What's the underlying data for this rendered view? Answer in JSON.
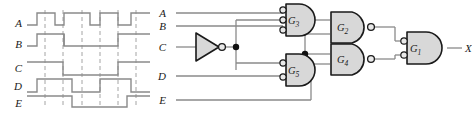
{
  "figure": {
    "wire_color": "#8a8a8a",
    "gate_stroke": "#1a1a1a",
    "gate_fill": "#d8d8d8",
    "dash_color": "#9a9a9a",
    "label_color": "#1a1a1a"
  },
  "timing": {
    "panel_label": "timing-diagram",
    "signals": [
      {
        "name": "A",
        "label": "A",
        "row": 0,
        "waveform": [
          0,
          1,
          0,
          1,
          1,
          0,
          1,
          0,
          1,
          0,
          1
        ],
        "description": "five pulses high"
      },
      {
        "name": "B",
        "label": "B",
        "row": 1,
        "waveform": [
          0,
          0,
          0,
          1,
          1,
          1,
          1,
          0,
          0,
          0,
          0
        ],
        "description": "one wide pulse in middle"
      },
      {
        "name": "C",
        "label": "C",
        "row": 2,
        "waveform": [
          1,
          1,
          1,
          0,
          0,
          0,
          0,
          0,
          1,
          1,
          1
        ],
        "description": "high at start, low in middle, high at end"
      },
      {
        "name": "D",
        "label": "D",
        "row": 3,
        "waveform": [
          0,
          1,
          1,
          0,
          0,
          0,
          1,
          1,
          1,
          0,
          0
        ],
        "description": "two high segments"
      },
      {
        "name": "E",
        "label": "E",
        "row": 4,
        "waveform": [
          0,
          0,
          0,
          1,
          1,
          1,
          1,
          1,
          0,
          0,
          0
        ],
        "description": "one wide pulse"
      }
    ],
    "gridline_count": 6
  },
  "circuit": {
    "panel_label": "logic-circuit",
    "inputs": [
      {
        "id": "in-A",
        "label": "A"
      },
      {
        "id": "in-B",
        "label": "B"
      },
      {
        "id": "in-C",
        "label": "C"
      },
      {
        "id": "in-D",
        "label": "D"
      },
      {
        "id": "in-E",
        "label": "E"
      }
    ],
    "output": {
      "id": "out-X",
      "label": "X"
    },
    "inverter": {
      "id": "inv-C",
      "label": "",
      "type": "inverter"
    },
    "gates": [
      {
        "id": "G3",
        "label": "G",
        "sub": "3",
        "type": "and-inverted-inputs",
        "inputs": 3
      },
      {
        "id": "G5",
        "label": "G",
        "sub": "5",
        "type": "and-inverted-inputs",
        "inputs": 2
      },
      {
        "id": "G2",
        "label": "G",
        "sub": "2",
        "type": "nand",
        "inputs": 2
      },
      {
        "id": "G4",
        "label": "G",
        "sub": "4",
        "type": "nand",
        "inputs": 2
      },
      {
        "id": "G1",
        "label": "G",
        "sub": "1",
        "type": "and-inverted-inputs",
        "inputs": 2
      }
    ],
    "junctions": [
      {
        "id": "node-c-inv",
        "name": "c-inverted-fanout"
      },
      {
        "id": "node-g5-out",
        "name": "g5-output-fanout"
      }
    ]
  }
}
